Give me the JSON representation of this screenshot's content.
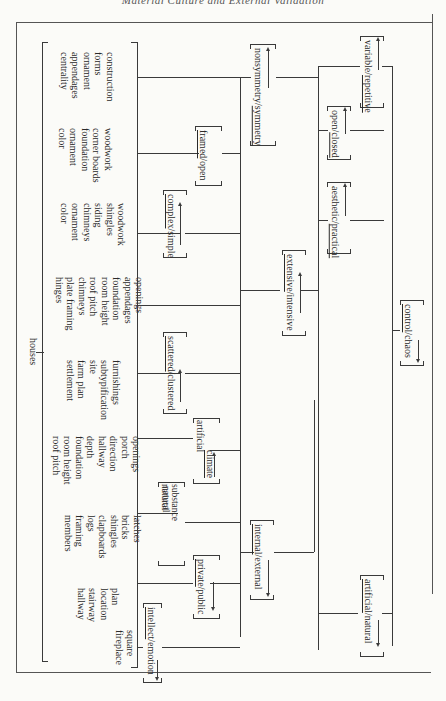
{
  "page": {
    "running_header": "Material Culture and External Validation",
    "orientation": "rotated 90° clockwise (text reads top-to-bottom)"
  },
  "root": {
    "label": "houses"
  },
  "groups": [
    {
      "id": "g1",
      "items": [
        "construction",
        "forms",
        "ornament",
        "appendages",
        "centrality"
      ]
    },
    {
      "id": "g2",
      "items": [
        "woodwork",
        "corner boards",
        "foundation",
        "ornament",
        "color"
      ]
    },
    {
      "id": "g3",
      "items": [
        "woodwork",
        "shingles",
        "siding",
        "chimneys",
        "ornament",
        "color"
      ]
    },
    {
      "id": "g4",
      "items": [
        "openings",
        "appendages",
        "foundation",
        "room height",
        "roof pitch",
        "chimneys",
        "plate framing",
        "hinges"
      ]
    },
    {
      "id": "g5",
      "items": [
        "furnishings",
        "subtypification",
        "site",
        "farm plan",
        "settlement"
      ]
    },
    {
      "id": "g6",
      "items": [
        "openings",
        "porch",
        "direction",
        "hallway",
        "depth",
        "foundation",
        "room height",
        "roof pitch"
      ]
    },
    {
      "id": "g7",
      "items": [
        "latches",
        "bricks",
        "shingles",
        "clapboards",
        "logs",
        "framing",
        "members"
      ]
    },
    {
      "id": "g8",
      "items": [
        "plan",
        "location",
        "stairway",
        "hallway"
      ]
    },
    {
      "id": "g9",
      "items": [
        "square",
        "fireplace"
      ]
    }
  ],
  "oppositions": {
    "intellect_emotion": {
      "a": "intellect",
      "sep": "/",
      "b": "emotion",
      "underlined": "a",
      "arrow": "left"
    },
    "private_public": {
      "a": "private",
      "sep": "/",
      "b": "public",
      "underlined": "a",
      "arrow": "left"
    },
    "substance": {
      "a_line1": "artificial",
      "a_line2": "substance",
      "b_line1": "natural",
      "b_line2": "substance",
      "underlined": "a",
      "arrow": "left"
    },
    "climate": {
      "a_line1": "artificial",
      "a_line2": "climate",
      "b_line1": "natural",
      "b_line2": "climate",
      "underlined": "a",
      "arrow": "right"
    },
    "scattered_clustered": {
      "a": "scattered",
      "sep": "/",
      "b": "clustered",
      "underlined": "a",
      "arrow": "right"
    },
    "complex_simple": {
      "a": "complex",
      "sep": "/",
      "b": "simple",
      "underlined": "a",
      "arrow": "right"
    },
    "framed_open": {
      "a": "framed",
      "sep": "/",
      "b": "open",
      "underlined": "a",
      "arrow": "none"
    },
    "internal_external": {
      "a": "internal",
      "sep": "/",
      "b": "external",
      "underlined": "a",
      "arrow": "left"
    },
    "extensive_intensive": {
      "a": "extensive",
      "sep": "/",
      "b": "intensive",
      "underlined": "a",
      "arrow": "right"
    },
    "nonsymmetry_symmetry": {
      "a": "nonsymmetry",
      "sep": "/",
      "b": "symmetry",
      "underlined": "b",
      "arrow": "right"
    },
    "aesthetic_practical": {
      "a": "aesthetic",
      "sep": "/",
      "b": "practical",
      "underlined": "b",
      "arrow": "right"
    },
    "open_closed": {
      "a": "open",
      "sep": "/",
      "b": "closed",
      "underlined": "b",
      "arrow": "right"
    },
    "variable_repetitive": {
      "a": "variable",
      "sep": "/",
      "b": "repetitive",
      "underlined": "b",
      "arrow": "right"
    },
    "control_chaos": {
      "a": "control",
      "sep": "/",
      "b": "chaos",
      "underlined": "a",
      "arrow": "left"
    },
    "artificial_natural": {
      "a": "artificial",
      "sep": "/",
      "b": "natural",
      "underlined": "a",
      "arrow": "left"
    }
  }
}
